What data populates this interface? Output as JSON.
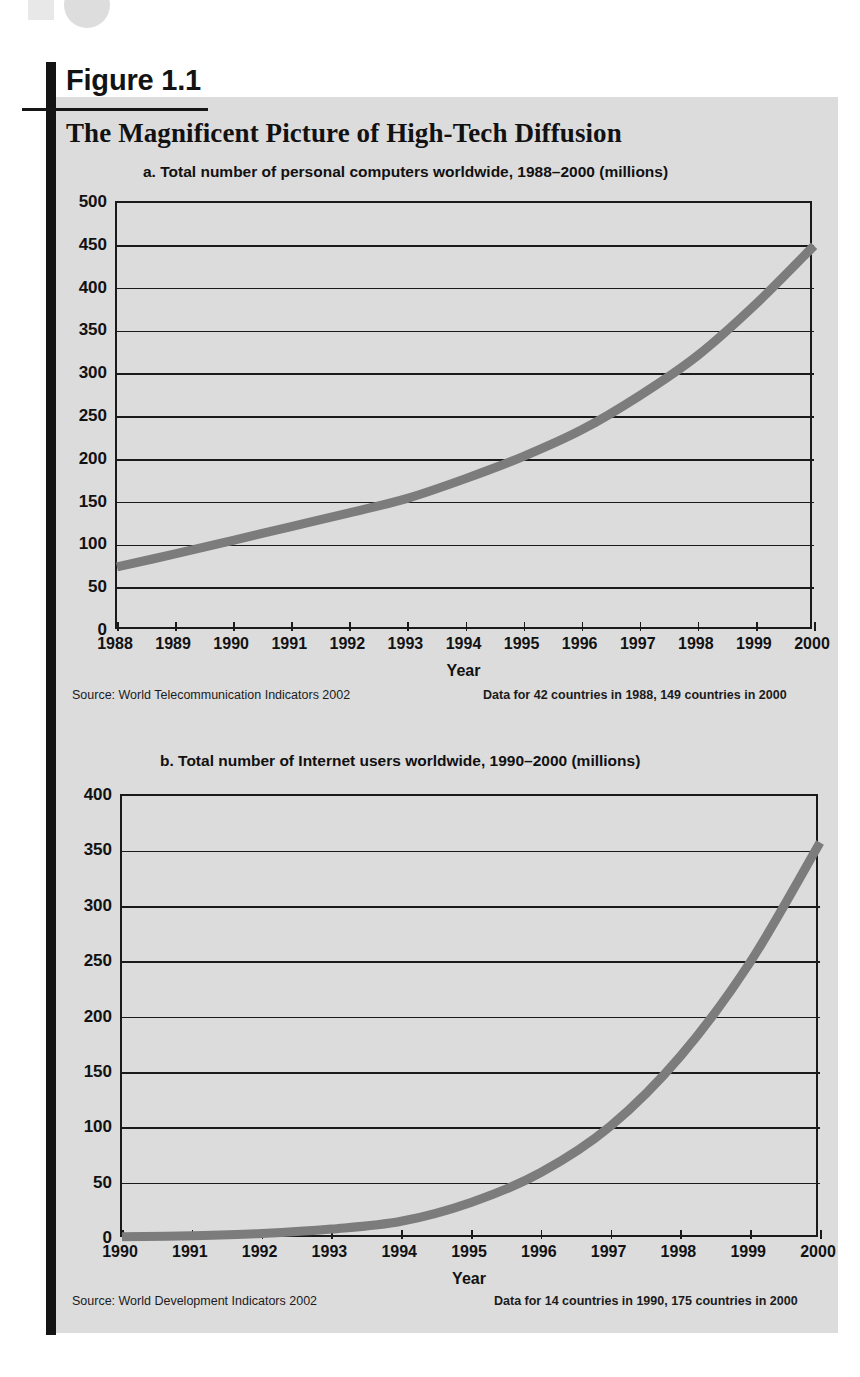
{
  "figure": {
    "label": "Figure 1.1",
    "title": "The Magnificent Picture of High-Tech Diffusion"
  },
  "chart_data": [
    {
      "id": "a",
      "type": "line",
      "title": "a.  Total number of personal computers worldwide, 1988–2000 (millions)",
      "xlabel": "Year",
      "ylabel": "",
      "ylim": [
        0,
        500
      ],
      "ytick_labels": [
        "0",
        "50",
        "100",
        "150",
        "200",
        "250",
        "300",
        "350",
        "400",
        "450",
        "500"
      ],
      "ytick_values": [
        0,
        50,
        100,
        150,
        200,
        250,
        300,
        350,
        400,
        450,
        500
      ],
      "grid": true,
      "legend": "none",
      "categories": [
        "1988",
        "1989",
        "1990",
        "1991",
        "1992",
        "1993",
        "1994",
        "1995",
        "1996",
        "1997",
        "1998",
        "1999",
        "2000"
      ],
      "x": [
        1988,
        1989,
        1990,
        1991,
        1992,
        1993,
        1994,
        1995,
        1996,
        1997,
        1998,
        1999,
        2000
      ],
      "values": [
        75,
        90,
        106,
        122,
        138,
        155,
        178,
        204,
        235,
        275,
        322,
        382,
        450
      ],
      "source": "Source: World Telecommunication Indicators 2002",
      "data_note": "Data for 42 countries in 1988, 149 countries in 2000"
    },
    {
      "id": "b",
      "type": "line",
      "title": "b.  Total number of Internet users worldwide, 1990–2000 (millions)",
      "xlabel": "Year",
      "ylabel": "",
      "ylim": [
        0,
        400
      ],
      "ytick_labels": [
        "0",
        "50",
        "100",
        "150",
        "200",
        "250",
        "300",
        "350",
        "400"
      ],
      "ytick_values": [
        0,
        50,
        100,
        150,
        200,
        250,
        300,
        350,
        400
      ],
      "grid": true,
      "legend": "none",
      "categories": [
        "1990",
        "1991",
        "1992",
        "1993",
        "1994",
        "1995",
        "1996",
        "1997",
        "1998",
        "1999",
        "2000"
      ],
      "x": [
        1990,
        1991,
        1992,
        1993,
        1994,
        1995,
        1996,
        1997,
        1998,
        1999,
        2000
      ],
      "values": [
        2,
        3,
        5,
        9,
        16,
        33,
        60,
        102,
        165,
        250,
        358
      ],
      "source": "Source: World Development Indicators 2002",
      "data_note": "Data for 14 countries in 1990, 175 countries in 2000"
    }
  ],
  "colors": {
    "panel_background": "#dcdcdc",
    "curve": "#7c7c7c",
    "axis": "#1a1a1a",
    "text": "#121212",
    "rule": "#141414"
  }
}
